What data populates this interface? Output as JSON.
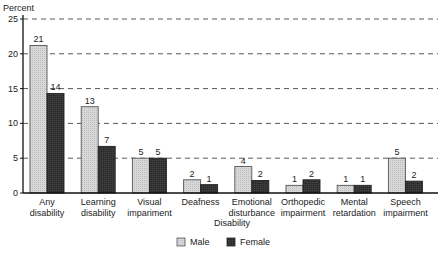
{
  "chart_data": {
    "type": "bar",
    "title": "",
    "ylabel": "Percent",
    "xlabel": "Disability",
    "ylim": [
      0,
      25
    ],
    "yticks": [
      0,
      5,
      10,
      15,
      20,
      25
    ],
    "grid": "horizontal dashed",
    "legend_position": "bottom",
    "categories": [
      [
        "Any",
        "disability"
      ],
      [
        "Learning",
        "disability"
      ],
      [
        "Visual",
        "impariment"
      ],
      [
        "Deafness"
      ],
      [
        "Emotional",
        "disturbance"
      ],
      [
        "Orthopedic",
        "impairment"
      ],
      [
        "Mental",
        "retardation"
      ],
      [
        "Speech",
        "impairment"
      ]
    ],
    "series": [
      {
        "name": "Male",
        "color": "#d4d4d4",
        "values": [
          21.2,
          12.4,
          5.0,
          1.9,
          3.8,
          1.1,
          1.1,
          5.0
        ],
        "labels": [
          "21",
          "13",
          "5",
          "2",
          "4",
          "1",
          "1",
          "5"
        ]
      },
      {
        "name": "Female",
        "color": "#2e2e2e",
        "values": [
          14.3,
          6.7,
          5.0,
          1.2,
          1.8,
          1.9,
          1.1,
          1.7
        ],
        "labels": [
          "14",
          "7",
          "5",
          "1",
          "2",
          "2",
          "1",
          "2"
        ]
      }
    ]
  }
}
